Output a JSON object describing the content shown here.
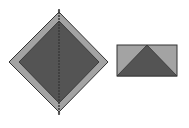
{
  "diagram": {
    "colors": {
      "background": "#ffffff",
      "outer_fill": "#a3a3a3",
      "inner_fill": "#545454",
      "stroke": "#333333",
      "center_line": "#3a3a3a"
    },
    "shapes": [
      {
        "id": "diamond-outer",
        "type": "polygon",
        "description": "Large light-gray diamond with dark border"
      },
      {
        "id": "diamond-inner",
        "type": "polygon",
        "description": "Inner dark-gray diamond"
      },
      {
        "id": "diamond-axis",
        "type": "dashed-line",
        "description": "Vertical dashed center line through diamond"
      },
      {
        "id": "rectangle",
        "type": "rect",
        "description": "Light-gray rectangle with dark border"
      },
      {
        "id": "triangle",
        "type": "polygon",
        "description": "Dark-gray triangle inside rectangle, apex at top center"
      }
    ]
  }
}
